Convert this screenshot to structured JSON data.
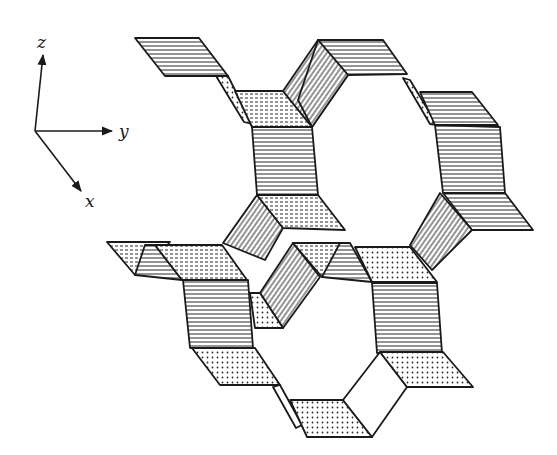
{
  "figure": {
    "type": "3D framework structure drawing",
    "axes": {
      "z_label": "z",
      "y_label": "y",
      "x_label": "x"
    },
    "face_styles": {
      "horizontal": "horizontal-hatched",
      "slanted": "diagonal-hatched",
      "dotted": "stippled"
    },
    "colors": {
      "ink": "#1a1a1a",
      "paper": "#ffffff"
    }
  }
}
